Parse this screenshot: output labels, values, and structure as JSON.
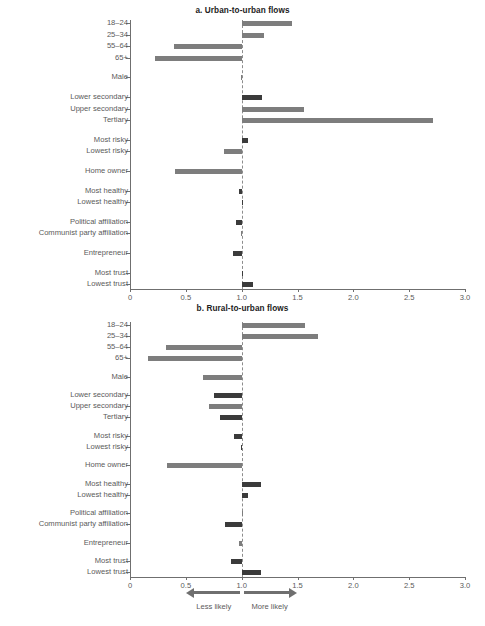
{
  "figure": {
    "axis": {
      "min": 0,
      "max": 3.0,
      "reference": 1.0,
      "ticks": [
        "0",
        "0.5",
        "1.0",
        "1.5",
        "2.0",
        "2.5",
        "3.0"
      ],
      "tick_values": [
        0,
        0.5,
        1.0,
        1.5,
        2.0,
        2.5,
        3.0
      ]
    },
    "legend": {
      "less_label": "Less likely",
      "more_label": "More likely",
      "less_icon": "arrow-left-icon",
      "more_icon": "arrow-right-icon"
    },
    "colors": {
      "bar_light": "#7d7d7d",
      "bar_dark": "#3b3b3b",
      "axis": "#6f6f6f",
      "text": "#5a5a5a"
    }
  },
  "chart_data": [
    {
      "type": "bar",
      "orientation": "horizontal",
      "title": "a. Urban-to-urban flows",
      "xlabel": "",
      "ylabel": "",
      "xlim": [
        0,
        3.0
      ],
      "reference_line": 1.0,
      "grid": false,
      "legend_position": "bottom",
      "categories": [
        "18–24",
        "25–34",
        "55–64",
        "65+",
        "Male",
        "Lower secondary",
        "Upper secondary",
        "Tertiary",
        "Most risky",
        "Lowest risky",
        "Home owner",
        "Most healthy",
        "Lowest healthy",
        "Political affiliation",
        "Communist party affiliation",
        "Entrepreneur",
        "Most trust",
        "Lowest trust"
      ],
      "values": [
        1.45,
        1.2,
        0.39,
        0.22,
        0.99,
        1.18,
        1.56,
        2.71,
        1.06,
        0.84,
        0.4,
        0.98,
        1.01,
        0.95,
        0.99,
        0.92,
        1.01,
        1.1
      ],
      "shades": [
        "light",
        "light",
        "light",
        "light",
        "light",
        "dark",
        "light",
        "light",
        "dark",
        "light",
        "light",
        "dark",
        "dark",
        "dark",
        "light",
        "dark",
        "dark",
        "dark"
      ],
      "groups": [
        4,
        1,
        3,
        2,
        1,
        2,
        2,
        1,
        2
      ]
    },
    {
      "type": "bar",
      "orientation": "horizontal",
      "title": "b. Rural-to-urban flows",
      "xlabel": "",
      "ylabel": "",
      "xlim": [
        0,
        3.0
      ],
      "reference_line": 1.0,
      "grid": false,
      "legend_position": "bottom",
      "categories": [
        "18–24",
        "25–34",
        "55–64",
        "65+",
        "Male",
        "Lower secondary",
        "Upper secondary",
        "Tertiary",
        "Most risky",
        "Lowest risky",
        "Home owner",
        "Most healthy",
        "Lowest healthy",
        "Political affiliation",
        "Communist party affiliation",
        "Entrepreneur",
        "Most trust",
        "Lowest trust"
      ],
      "values": [
        1.57,
        1.68,
        0.32,
        0.16,
        0.65,
        0.75,
        0.71,
        0.81,
        0.93,
        0.99,
        0.33,
        1.17,
        1.06,
        1.0,
        0.85,
        0.98,
        0.9,
        1.17
      ],
      "shades": [
        "light",
        "light",
        "light",
        "light",
        "light",
        "dark",
        "light",
        "dark",
        "dark",
        "dark",
        "light",
        "dark",
        "dark",
        "light",
        "dark",
        "light",
        "dark",
        "dark"
      ],
      "groups": [
        4,
        1,
        3,
        2,
        1,
        2,
        2,
        1,
        2
      ]
    }
  ]
}
